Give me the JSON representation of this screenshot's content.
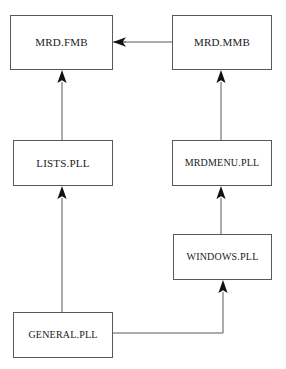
{
  "diagram": {
    "background_color": "#ffffff",
    "line_color": "#585858",
    "arrow_color": "#111111",
    "text_color": "#1a1a1a",
    "nodes": [
      {
        "id": "mrd_fmb",
        "label": "MRD.FMB",
        "x": 10,
        "y": 15,
        "w": 103,
        "h": 55
      },
      {
        "id": "mrd_mmb",
        "label": "MRD.MMB",
        "x": 172,
        "y": 15,
        "w": 100,
        "h": 55
      },
      {
        "id": "lists",
        "label": "LISTS.PLL",
        "x": 13,
        "y": 140,
        "w": 100,
        "h": 46
      },
      {
        "id": "mrdmenu",
        "label": "MRDMENU.PLL",
        "x": 172,
        "y": 140,
        "w": 100,
        "h": 46
      },
      {
        "id": "windows",
        "label": "WINDOWS.PLL",
        "x": 173,
        "y": 234,
        "w": 99,
        "h": 46
      },
      {
        "id": "general",
        "label": "GENERAL.PLL",
        "x": 13,
        "y": 312,
        "w": 100,
        "h": 46
      }
    ],
    "edges": [
      {
        "id": "edge-mmb-to-fmb",
        "from": "mrd_mmb",
        "to": "mrd_fmb",
        "direction": "left"
      },
      {
        "id": "edge-lists-to-fmb",
        "from": "lists",
        "to": "mrd_fmb",
        "direction": "up"
      },
      {
        "id": "edge-mrdmenu-to-mmb",
        "from": "mrdmenu",
        "to": "mrd_mmb",
        "direction": "up"
      },
      {
        "id": "edge-general-to-lists",
        "from": "general",
        "to": "lists",
        "direction": "up"
      },
      {
        "id": "edge-windows-to-mrdmenu",
        "from": "windows",
        "to": "mrdmenu",
        "direction": "up"
      },
      {
        "id": "edge-general-to-windows",
        "from": "general",
        "to": "windows",
        "direction": "up-elbow"
      }
    ]
  }
}
